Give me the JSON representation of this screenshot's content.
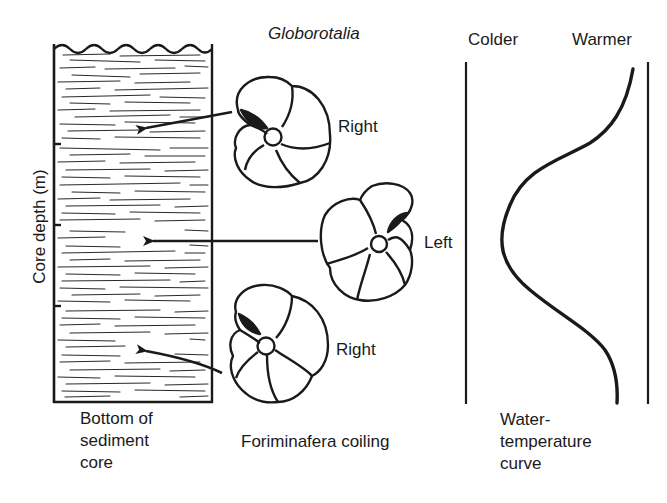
{
  "title": "Globorotalia",
  "sediment_core": {
    "axis_label": "Core depth (m)",
    "caption_lines": [
      "Bottom of",
      "sediment",
      "core"
    ]
  },
  "foraminifera": {
    "caption": "Foriminafera coiling",
    "specimens": [
      {
        "coiling": "Right",
        "depth_position": "upper"
      },
      {
        "coiling": "Left",
        "depth_position": "middle"
      },
      {
        "coiling": "Right",
        "depth_position": "lower"
      }
    ]
  },
  "temperature": {
    "left_label": "Colder",
    "right_label": "Warmer",
    "caption_lines": [
      "Water-",
      "temperature",
      "curve"
    ]
  },
  "colors": {
    "ink": "#1a1a1a",
    "background": "#ffffff"
  }
}
